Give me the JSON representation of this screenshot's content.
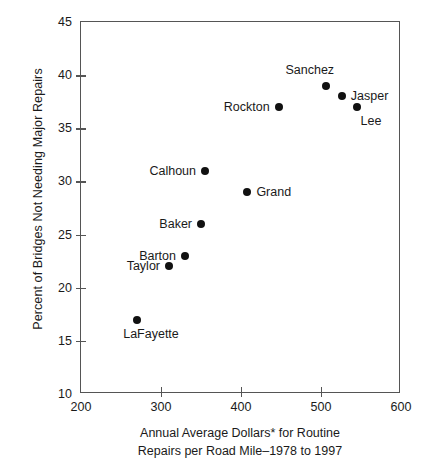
{
  "chart_data": {
    "type": "scatter",
    "title": "",
    "xlabel": "Annual Average Dollars* for Routine Repairs per Road Mile–1978 to 1997",
    "xlabel_lines": [
      "Annual Average Dollars* for Routine",
      "Repairs per Road Mile–1978 to 1997"
    ],
    "ylabel": "Percent of Bridges Not Needing Major Repairs",
    "xlim": [
      200,
      600
    ],
    "ylim": [
      10,
      45
    ],
    "xticks": [
      200,
      300,
      400,
      500,
      600
    ],
    "yticks": [
      10,
      15,
      20,
      25,
      30,
      35,
      40,
      45
    ],
    "xtick_labels": [
      "200",
      "300",
      "400",
      "500",
      "600"
    ],
    "ytick_labels": [
      "10",
      "15",
      "20",
      "25",
      "30",
      "35",
      "40",
      "45"
    ],
    "grid": false,
    "legend": "none",
    "marker_color": "#111111",
    "axis_color": "#555555",
    "points": [
      {
        "label": "LaFayette",
        "x": 270,
        "y": 17,
        "label_pos": "below"
      },
      {
        "label": "Taylor",
        "x": 310,
        "y": 22,
        "label_pos": "left"
      },
      {
        "label": "Barton",
        "x": 330,
        "y": 23,
        "label_pos": "left"
      },
      {
        "label": "Baker",
        "x": 350,
        "y": 26,
        "label_pos": "left"
      },
      {
        "label": "Calhoun",
        "x": 355,
        "y": 31,
        "label_pos": "left"
      },
      {
        "label": "Grand",
        "x": 408,
        "y": 29,
        "label_pos": "right"
      },
      {
        "label": "Rockton",
        "x": 447,
        "y": 37,
        "label_pos": "left"
      },
      {
        "label": "Sanchez",
        "x": 506,
        "y": 39,
        "label_pos": "above"
      },
      {
        "label": "Jasper",
        "x": 526,
        "y": 38,
        "label_pos": "right"
      },
      {
        "label": "Lee",
        "x": 545,
        "y": 37,
        "label_pos": "below"
      }
    ]
  }
}
